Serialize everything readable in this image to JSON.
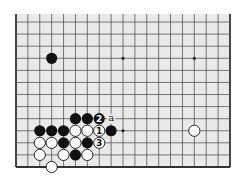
{
  "diagram": {
    "type": "go-board-partial",
    "board_size": 19,
    "visible": {
      "cols_from": 1,
      "cols_to": 19,
      "rows_from": 1,
      "rows_to": 13,
      "top_edge_cut": true
    },
    "colors": {
      "background": "#ffffff",
      "board": "#e9e9e9",
      "line": "#555555",
      "edge": "#333333",
      "black": "#111111",
      "white": "#ffffff",
      "star": "#222222"
    },
    "star_points": [
      {
        "col": 4,
        "row": 4
      },
      {
        "col": 10,
        "row": 4
      },
      {
        "col": 16,
        "row": 4
      },
      {
        "col": 4,
        "row": 10
      },
      {
        "col": 10,
        "row": 10
      },
      {
        "col": 16,
        "row": 10
      }
    ],
    "stones": [
      {
        "col": 4,
        "row": 10,
        "color": "black"
      },
      {
        "col": 6,
        "row": 5,
        "color": "black"
      },
      {
        "col": 7,
        "row": 5,
        "color": "black"
      },
      {
        "col": 8,
        "row": 5,
        "color": "black",
        "label": "2"
      },
      {
        "col": 3,
        "row": 4,
        "color": "black"
      },
      {
        "col": 4,
        "row": 4,
        "color": "black"
      },
      {
        "col": 5,
        "row": 4,
        "color": "black"
      },
      {
        "col": 6,
        "row": 4,
        "color": "white"
      },
      {
        "col": 7,
        "row": 4,
        "color": "white"
      },
      {
        "col": 8,
        "row": 4,
        "color": "white",
        "label": "1"
      },
      {
        "col": 9,
        "row": 4,
        "color": "black"
      },
      {
        "col": 3,
        "row": 3,
        "color": "white"
      },
      {
        "col": 4,
        "row": 3,
        "color": "white"
      },
      {
        "col": 5,
        "row": 3,
        "color": "black"
      },
      {
        "col": 6,
        "row": 3,
        "color": "white"
      },
      {
        "col": 7,
        "row": 3,
        "color": "black"
      },
      {
        "col": 8,
        "row": 3,
        "color": "white",
        "label": "3"
      },
      {
        "col": 3,
        "row": 2,
        "color": "white"
      },
      {
        "col": 5,
        "row": 2,
        "color": "white"
      },
      {
        "col": 6,
        "row": 2,
        "color": "black"
      },
      {
        "col": 7,
        "row": 2,
        "color": "white"
      },
      {
        "col": 4,
        "row": 1,
        "color": "white"
      },
      {
        "col": 16,
        "row": 4,
        "color": "white"
      }
    ],
    "markers": [
      {
        "col": 9,
        "row": 5,
        "text": "a"
      }
    ]
  }
}
